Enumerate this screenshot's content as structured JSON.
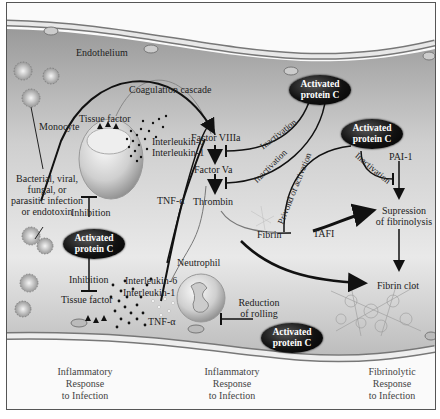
{
  "diagram": {
    "labels": {
      "endothelium": "Endothelium",
      "coagulation_cascade": "Coagulation cascade",
      "tissue_factor_top": "Tissue factor",
      "monocyte": "Monocyte",
      "interleukin6_top": "Interleukin-6",
      "interleukin1_top": "Interleukin-1",
      "infection_source": [
        "Bacterial, viral,",
        "fungal, or",
        "parasitic infection",
        "or endotoxin"
      ],
      "tnf_alpha_mid": "TNF-α",
      "inhibition_1": "Inhibition",
      "inhibition_2": "Inhibition",
      "tissue_factor_bottom": "Tissue factor",
      "interleukin6_bottom": "Interleukin-6",
      "interleukin1_bottom": "Interleukin-1",
      "tnf_alpha_bottom": "TNF-α",
      "neutrophil": "Neutrophil",
      "reduction_of_rolling": [
        "Reduction",
        "of rolling"
      ],
      "factor_viiia": "Factor VIIIa",
      "factor_va": "Factor Va",
      "thrombin": "Thrombin",
      "inactivation_1": "Inactivation",
      "inactivation_2": "Inactivation",
      "inactivation_3": "Inactivation",
      "privond_of_activation": "Privond of activation",
      "pai1": "PAI-1",
      "tafi": "TAFI",
      "suppression": [
        "Supression",
        "of fibrinolysis"
      ],
      "fibrin": "Fibrin",
      "fibrin_clot": "Fibrin clot"
    },
    "activated_protein_c": [
      "Activated",
      "protein C"
    ],
    "footer": [
      {
        "lines": [
          "Inflammatory",
          "Response",
          "to Infection"
        ]
      },
      {
        "lines": [
          "Inflammatory",
          "Response",
          "to Infection"
        ]
      },
      {
        "lines": [
          "Fibrinolytic",
          "Response",
          "to Infection"
        ]
      }
    ]
  }
}
